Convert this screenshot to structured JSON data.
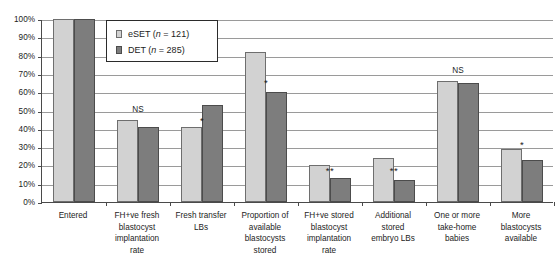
{
  "chart_data": {
    "type": "bar",
    "title": "",
    "subtitle": "",
    "xlabel": "",
    "ylabel": "",
    "ylim": [
      0,
      100
    ],
    "ytick_labels": [
      "100%",
      "90%",
      "80%",
      "70%",
      "60%",
      "50%",
      "40%",
      "30%",
      "20%",
      "10%",
      "0%"
    ],
    "ytick_values": [
      100,
      90,
      80,
      70,
      60,
      50,
      40,
      30,
      20,
      10,
      0
    ],
    "grid": true,
    "legend_position": "top-left-inside",
    "categories": [
      "Entered",
      "FH+ve fresh blastocyst implantation rate",
      "Fresh transfer LBs",
      "Proportion of available blastocysts stored",
      "FH+ve stored blastocyst implantation rate",
      "Additional stored embryo LBs",
      "One or more take-home babies",
      "More blastocysts available"
    ],
    "category_lines": [
      [
        "Entered"
      ],
      [
        "FH+ve fresh",
        "blastocyst",
        "implantation",
        "rate"
      ],
      [
        "Fresh transfer",
        "LBs"
      ],
      [
        "Proportion of",
        "available",
        "blastocysts",
        "stored"
      ],
      [
        "FH+ve stored",
        "blastocyst",
        "implantation",
        "rate"
      ],
      [
        "Additional",
        "stored",
        "embryo LBs"
      ],
      [
        "One or more",
        "take-home",
        "babies"
      ],
      [
        "More",
        "blastocysts",
        "available"
      ]
    ],
    "series": [
      {
        "name": "eSET (n = 121)",
        "color": "#d2d2d2",
        "values": [
          100,
          45,
          41,
          82,
          20,
          24,
          66,
          29
        ]
      },
      {
        "name": "DET (n = 285)",
        "color": "#7d7d7d",
        "values": [
          100,
          41,
          53,
          60,
          13,
          12,
          65,
          23
        ]
      }
    ],
    "annotations": [
      {
        "category_index": 1,
        "text": "NS",
        "value": 50
      },
      {
        "category_index": 2,
        "text": "*",
        "value": 44
      },
      {
        "category_index": 3,
        "text": "*",
        "value": 65
      },
      {
        "category_index": 4,
        "text": "**",
        "value": 17
      },
      {
        "category_index": 5,
        "text": "**",
        "value": 17
      },
      {
        "category_index": 6,
        "text": "NS",
        "value": 71
      },
      {
        "category_index": 7,
        "text": "*",
        "value": 31
      }
    ]
  },
  "legend": {
    "items": [
      {
        "label_main": "eSET (",
        "label_italic": "n",
        "label_tail": " = 121)",
        "swatch": "eset"
      },
      {
        "label_main": "DET (",
        "label_italic": "n",
        "label_tail": " = 285)",
        "swatch": "det"
      }
    ]
  }
}
